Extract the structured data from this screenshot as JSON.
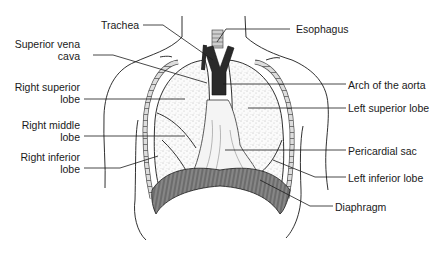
{
  "diagram": {
    "type": "anatomical-illustration",
    "colors": {
      "line": "#1a1a1a",
      "stipple": "#888888",
      "background": "#ffffff",
      "dark": "#2a2a2a"
    },
    "labels_left": [
      {
        "id": "trachea",
        "text": "Trachea"
      },
      {
        "id": "svc_1",
        "text": "Superior vena"
      },
      {
        "id": "svc_2",
        "text": "cava"
      },
      {
        "id": "rsl_1",
        "text": "Right superior"
      },
      {
        "id": "rsl_2",
        "text": "lobe"
      },
      {
        "id": "rml_1",
        "text": "Right middle"
      },
      {
        "id": "rml_2",
        "text": "lobe"
      },
      {
        "id": "ril_1",
        "text": "Right inferior"
      },
      {
        "id": "ril_2",
        "text": "lobe"
      }
    ],
    "labels_right": [
      {
        "id": "esophagus",
        "text": "Esophagus"
      },
      {
        "id": "aorta",
        "text": "Arch of the aorta"
      },
      {
        "id": "lsl",
        "text": "Left superior lobe"
      },
      {
        "id": "pericardial",
        "text": "Pericardial sac"
      },
      {
        "id": "lil",
        "text": "Left inferior lobe"
      },
      {
        "id": "diaphragm",
        "text": "Diaphragm"
      }
    ]
  }
}
